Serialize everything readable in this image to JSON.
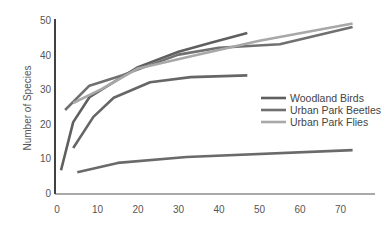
{
  "chart_data": {
    "type": "line",
    "title": "",
    "xlabel": "",
    "ylabel": "Number of Species",
    "xlim": [
      0,
      75
    ],
    "ylim": [
      0,
      50
    ],
    "x_ticks": [
      0,
      10,
      20,
      30,
      40,
      50,
      60,
      70
    ],
    "y_ticks": [
      0,
      10,
      20,
      30,
      40,
      50
    ],
    "grid": false,
    "legend_position": "center-right",
    "series": [
      {
        "name": "Woodland Birds",
        "color": "#5f5f5f",
        "legend": true,
        "x": [
          1,
          4,
          8,
          20,
          30,
          38,
          47
        ],
        "y": [
          6.6,
          20.5,
          27.7,
          36.4,
          40.8,
          43.4,
          46.2
        ]
      },
      {
        "name": "Urban Park Beetles",
        "color": "#707070",
        "legend": true,
        "x": [
          2,
          8,
          16,
          30,
          40,
          55,
          73
        ],
        "y": [
          24,
          31,
          34,
          40,
          42,
          43,
          48
        ]
      },
      {
        "name": "Urban Park Flies",
        "color": "#a8a8a8",
        "legend": true,
        "x": [
          4,
          11,
          20,
          35,
          50,
          73
        ],
        "y": [
          26,
          30,
          36,
          40,
          44,
          49
        ]
      },
      {
        "name": "",
        "color": "#666666",
        "legend": false,
        "x": [
          4,
          9,
          14,
          23,
          33,
          47
        ],
        "y": [
          13,
          22,
          27.5,
          32,
          33.5,
          34
        ]
      },
      {
        "name": "",
        "color": "#6a6a6a",
        "legend": false,
        "x": [
          5,
          15,
          32,
          73
        ],
        "y": [
          6,
          8.7,
          10.4,
          12.4
        ]
      }
    ]
  }
}
